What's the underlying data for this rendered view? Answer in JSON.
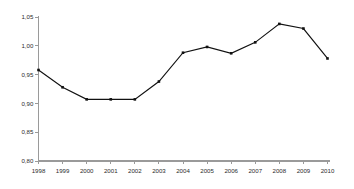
{
  "chart_data": {
    "type": "line",
    "title": "",
    "subtitle": "",
    "xlabel": "",
    "ylabel": "",
    "categories": [
      "1998",
      "1999",
      "2000",
      "2001",
      "2002",
      "2003",
      "2004",
      "2005",
      "2006",
      "2007",
      "2008",
      "2009",
      "2010"
    ],
    "values": [
      0.958,
      0.928,
      0.907,
      0.907,
      0.907,
      0.938,
      0.988,
      0.998,
      0.987,
      1.006,
      1.038,
      1.03,
      0.978
    ],
    "series": [
      {
        "name": "",
        "values": [
          0.958,
          0.928,
          0.907,
          0.907,
          0.907,
          0.938,
          0.988,
          0.998,
          0.987,
          1.006,
          1.038,
          1.03,
          0.978
        ]
      }
    ],
    "ylim": [
      0.8,
      1.05
    ],
    "xlim": [
      0,
      12
    ],
    "ytick_values": [
      0.8,
      0.85,
      0.9,
      0.95,
      1.0,
      1.05
    ],
    "ytick_labels": [
      "0,80",
      "0,85",
      "0,90",
      "0,95",
      "1,00",
      "1,05"
    ],
    "xtick_labels": [
      "1998",
      "1999",
      "2000",
      "2001",
      "2002",
      "2003",
      "2004",
      "2005",
      "2006",
      "2007",
      "2008",
      "2009",
      "2010"
    ],
    "grid": false,
    "legend": null,
    "legend_position": "none",
    "decimal_separator": ",",
    "annotations": [],
    "colors": {
      "line": "#111111",
      "marker": "#111111",
      "axis": "#9a9a9a",
      "tick_text": "#2b2b2b",
      "background": "#ffffff"
    },
    "marker_style": "square",
    "marker_size": 2.6
  }
}
